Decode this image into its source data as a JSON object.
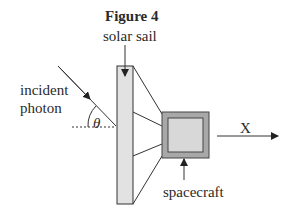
{
  "figure": {
    "title": "Figure 4",
    "labels": {
      "solar_sail": "solar sail",
      "incident_line1": "incident",
      "incident_line2": "photon",
      "angle": "θ",
      "direction": "X",
      "spacecraft": "spacecraft"
    },
    "colors": {
      "stroke": "#333333",
      "sail_fill": "#e2e2e2",
      "craft_outer": "#a8a8a8",
      "craft_inner": "#d8d8d8"
    }
  }
}
